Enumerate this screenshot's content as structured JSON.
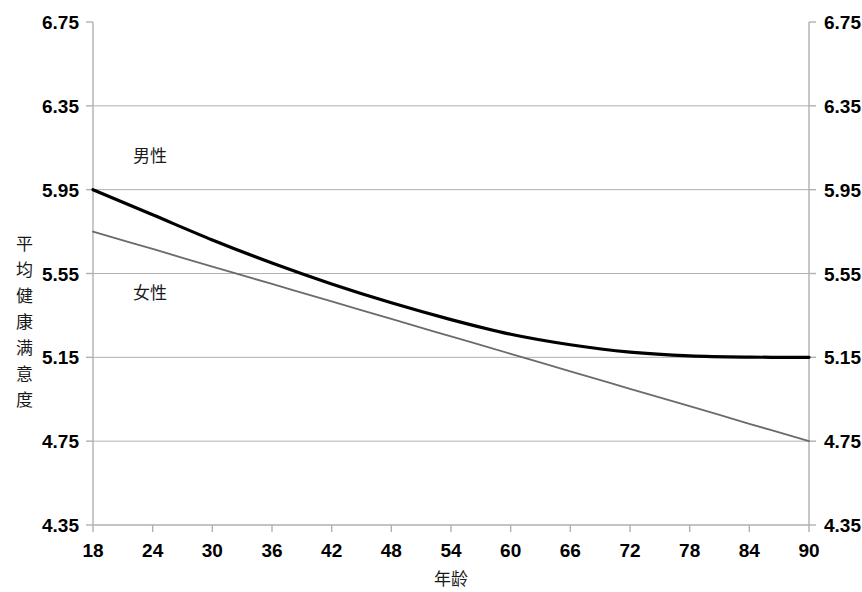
{
  "chart_data": {
    "type": "line",
    "title": "",
    "xlabel": "年龄",
    "ylabel": "平均健康满意度",
    "xlim": [
      18,
      90
    ],
    "ylim": [
      4.35,
      6.75
    ],
    "grid": true,
    "legend_position": "inline-labels",
    "x_ticks": [
      "18",
      "24",
      "30",
      "36",
      "42",
      "48",
      "54",
      "60",
      "66",
      "72",
      "78",
      "84",
      "90"
    ],
    "y_ticks": [
      "4.35",
      "4.75",
      "5.15",
      "5.55",
      "5.95",
      "6.35",
      "6.75"
    ],
    "y_ticks_right": [
      "4.35",
      "4.75",
      "5.15",
      "5.55",
      "5.95",
      "6.35",
      "6.75"
    ],
    "x": [
      18,
      24,
      30,
      36,
      42,
      48,
      54,
      60,
      66,
      72,
      78,
      84,
      90
    ],
    "series": [
      {
        "name": "男性",
        "color": "#000000",
        "width": 3.2,
        "label_x": 22,
        "label_y": 6.08,
        "values": [
          5.95,
          5.83,
          5.71,
          5.6,
          5.5,
          5.41,
          5.33,
          5.26,
          5.21,
          5.175,
          5.157,
          5.151,
          5.15
        ]
      },
      {
        "name": "女性",
        "color": "#6b6b6b",
        "width": 1.8,
        "label_x": 22,
        "label_y": 5.43,
        "values": [
          5.75,
          5.667,
          5.583,
          5.5,
          5.417,
          5.333,
          5.25,
          5.167,
          5.083,
          5.0,
          4.917,
          4.833,
          4.75
        ]
      }
    ]
  },
  "axis": {
    "y_axis_title_chars": [
      "平",
      "均",
      "健",
      "康",
      "满",
      "意",
      "度"
    ]
  }
}
